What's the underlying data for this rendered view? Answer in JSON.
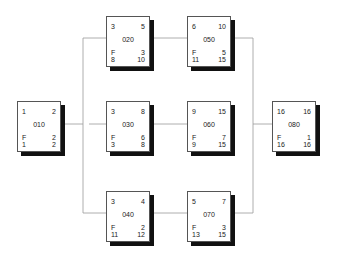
{
  "diagram": {
    "type": "network-precedence-diagram",
    "float_label": "F",
    "nodes": [
      {
        "id": "010",
        "early_start": "1",
        "early_finish": "2",
        "float": "2",
        "late_start": "1",
        "late_finish": "2"
      },
      {
        "id": "020",
        "early_start": "3",
        "early_finish": "5",
        "float": "3",
        "late_start": "8",
        "late_finish": "10"
      },
      {
        "id": "030",
        "early_start": "3",
        "early_finish": "8",
        "float": "6",
        "late_start": "3",
        "late_finish": "8"
      },
      {
        "id": "040",
        "early_start": "3",
        "early_finish": "4",
        "float": "2",
        "late_start": "11",
        "late_finish": "12"
      },
      {
        "id": "050",
        "early_start": "6",
        "early_finish": "10",
        "float": "5",
        "late_start": "11",
        "late_finish": "15"
      },
      {
        "id": "060",
        "early_start": "9",
        "early_finish": "15",
        "float": "7",
        "late_start": "9",
        "late_finish": "15"
      },
      {
        "id": "070",
        "early_start": "5",
        "early_finish": "7",
        "float": "3",
        "late_start": "13",
        "late_finish": "15"
      },
      {
        "id": "080",
        "early_start": "16",
        "early_finish": "16",
        "float": "1",
        "late_start": "16",
        "late_finish": "16"
      }
    ],
    "edges": [
      [
        "010",
        "020"
      ],
      [
        "010",
        "030"
      ],
      [
        "010",
        "040"
      ],
      [
        "020",
        "050"
      ],
      [
        "030",
        "060"
      ],
      [
        "040",
        "070"
      ],
      [
        "050",
        "080"
      ],
      [
        "060",
        "080"
      ],
      [
        "070",
        "080"
      ]
    ]
  }
}
